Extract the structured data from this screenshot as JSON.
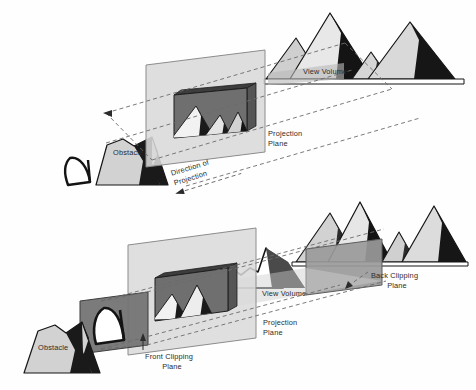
{
  "figure": {
    "title_visible": false,
    "background_color": "#fefefe",
    "panels": [
      {
        "id": "top",
        "name": "parallel-projection-view-volume",
        "labels": {
          "obstacle": "Obstacle",
          "view_volume": "View Volume",
          "projection_plane_line1": "Projection",
          "projection_plane_line2": "Plane",
          "direction_line1": "Direction of",
          "direction_line2": "Projection"
        }
      },
      {
        "id": "bottom",
        "name": "parallel-projection-clipping-planes",
        "labels": {
          "obstacle": "Obstacle",
          "view_volume": "View Volume",
          "projection_plane_line1": "Projection",
          "projection_plane_line2": "Plane",
          "front_clipping_line1": "Front Clipping",
          "front_clipping_line2": "Plane",
          "back_clipping_line1": "Back Clipping",
          "back_clipping_line2": "Plane"
        }
      }
    ],
    "colors": {
      "ink": "#2b2b2b",
      "outline": "#141414",
      "mountain_light": "#d2d2d2",
      "mountain_mid": "#a8a8a8",
      "mountain_dark": "#1a1a1a",
      "plane_light": "#d9d9d9",
      "plane_mid": "#9a9a9a",
      "plane_dark": "#5d5d5d",
      "window_fill": "#6f6f6f",
      "dashed_line": "#6b6b6b",
      "ground": "#ffffff"
    },
    "icons": {
      "eye_top": "eye-viewpoint-icon",
      "eye_bottom": "eye-viewpoint-icon",
      "arrow_left_top": "arrow-left-icon",
      "arrow_direction": "arrow-left-icon",
      "arrow_front_clip": "arrow-leader-icon",
      "arrow_back_clip": "arrow-leader-icon"
    }
  }
}
